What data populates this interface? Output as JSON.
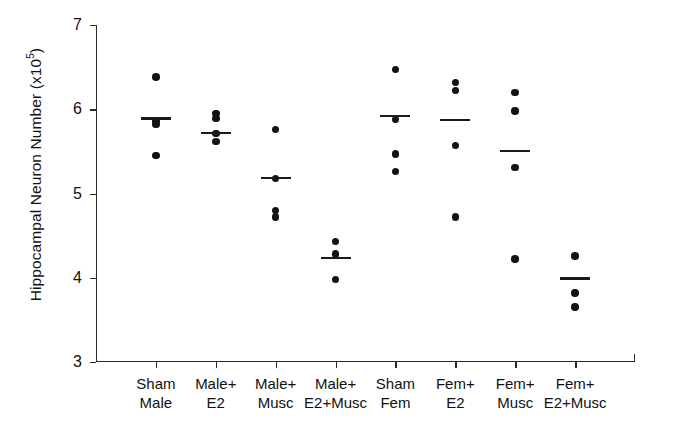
{
  "chart_data": {
    "type": "scatter",
    "title": "",
    "xlabel": "",
    "ylabel": "Hippocampal Neuron Number (x10",
    "ylabel_exponent": "5",
    "ylabel_suffix": ")",
    "ylim": [
      3,
      7
    ],
    "yticks": [
      3,
      4,
      5,
      6,
      7
    ],
    "ytick_labels": [
      "3",
      "4",
      "5",
      "6",
      "7"
    ],
    "grid": false,
    "legend": "none",
    "categories": [
      {
        "line1": "Sham",
        "line2": "Male"
      },
      {
        "line1": "Male+",
        "line2": "E2"
      },
      {
        "line1": "Male+",
        "line2": "Musc"
      },
      {
        "line1": "Male+",
        "line2": "E2+Musc"
      },
      {
        "line1": "Sham",
        "line2": "Fem"
      },
      {
        "line1": "Fem+",
        "line2": "E2"
      },
      {
        "line1": "Fem+",
        "line2": "Musc"
      },
      {
        "line1": "Fem+",
        "line2": "E2+Musc"
      }
    ],
    "groups": [
      {
        "name": "Sham Male",
        "values": [
          6.38,
          5.86,
          5.82,
          5.45
        ],
        "mean": 5.89
      },
      {
        "name": "Male+ E2",
        "values": [
          5.95,
          5.89,
          5.71,
          5.62
        ],
        "mean": 5.72
      },
      {
        "name": "Male+ Musc",
        "values": [
          5.76,
          5.18,
          4.8,
          4.72
        ],
        "mean": 5.18
      },
      {
        "name": "Male+ E2+Musc",
        "values": [
          4.43,
          4.28,
          3.98
        ],
        "mean": 4.23
      },
      {
        "name": "Sham Fem",
        "values": [
          6.47,
          5.88,
          5.47,
          5.26
        ],
        "mean": 5.92
      },
      {
        "name": "Fem+ E2",
        "values": [
          6.32,
          6.22,
          5.57,
          4.72
        ],
        "mean": 5.87
      },
      {
        "name": "Fem+ Musc",
        "values": [
          6.2,
          5.98,
          5.31,
          4.22
        ],
        "mean": 5.5
      },
      {
        "name": "Fem+ E2+Musc",
        "values": [
          4.26,
          3.82,
          3.65
        ],
        "mean": 3.99
      }
    ],
    "marker_color": "#121212",
    "mean_line_color": "#1a1a1a",
    "axis_color": "#2b2b2b"
  }
}
